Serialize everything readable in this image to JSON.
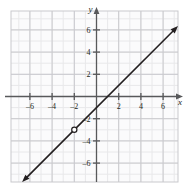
{
  "figure": {
    "name": "coordinate-plane-line-graph",
    "background_color": "#ffffff",
    "grid_color_minor": "#e8e8ea",
    "grid_color_major": "#c9c9cd",
    "axis_color": "#58595b",
    "curve_color": "#231f20"
  },
  "axes": {
    "x_axis_label": "x",
    "y_axis_label": "y",
    "x_ticks": [
      "-6",
      "-4",
      "-2",
      "2",
      "4",
      "6"
    ],
    "x_tick_values": [
      -6,
      -4,
      -2,
      2,
      4,
      6
    ],
    "y_ticks": [
      "6",
      "4",
      "2",
      "-2",
      "-4",
      "-6"
    ],
    "y_tick_values": [
      6,
      4,
      2,
      -2,
      -4,
      -6
    ],
    "xlim": [
      -7.7,
      7.5
    ],
    "ylim": [
      -7.8,
      7.5
    ],
    "grid": true,
    "minor_grid_step": 1,
    "major_grid_step": 2
  },
  "chart_data": {
    "type": "line",
    "title": "",
    "xlabel": "x",
    "ylabel": "y",
    "xlim": [
      -7.7,
      7.5
    ],
    "ylim": [
      -7.8,
      7.5
    ],
    "grid": true,
    "legend": "none",
    "series": [
      {
        "name": "line",
        "equation": "y = x - 1",
        "slope": 1,
        "intercept": -1,
        "arrow_start": true,
        "arrow_end": true,
        "x": [
          -6.6,
          6.9
        ],
        "y": [
          -7.6,
          5.9
        ]
      }
    ],
    "points": [
      {
        "name": "open-circle-hole",
        "style": "open",
        "x": -2,
        "y": -3,
        "label": ""
      }
    ]
  }
}
